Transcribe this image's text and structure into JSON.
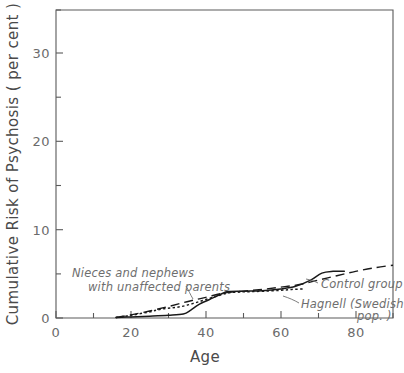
{
  "chart_data": {
    "type": "line",
    "title": "",
    "xlabel": "Age",
    "ylabel": "Cumulative Risk of Psychosis ( per cent )",
    "xlim": [
      0,
      90
    ],
    "ylim": [
      0,
      35
    ],
    "xticks": [
      0,
      20,
      40,
      60,
      80
    ],
    "xtick_labels": [
      "0",
      "20",
      "40",
      "60",
      "80"
    ],
    "xticks_minor": [
      10,
      30,
      50,
      70
    ],
    "yticks": [
      0,
      10,
      20,
      30
    ],
    "ytick_labels": [
      "0",
      "10",
      "20",
      "30"
    ],
    "yticks_minor": [
      5,
      15,
      25,
      35
    ],
    "grid": false,
    "legend_position": "inline-annotations",
    "series": [
      {
        "name": "Nieces and nephews with unaffected parents",
        "style": "solid",
        "x": [
          16,
          20,
          25,
          30,
          34,
          36,
          38,
          41,
          44,
          46,
          50,
          55,
          60,
          64,
          68,
          71,
          74,
          77
        ],
        "y": [
          0.05,
          0.12,
          0.2,
          0.3,
          0.45,
          0.9,
          1.5,
          2.1,
          2.7,
          3.0,
          3.05,
          3.1,
          3.3,
          3.6,
          4.3,
          5.1,
          5.3,
          5.3
        ]
      },
      {
        "name": "Control group",
        "style": "dashed",
        "x": [
          16,
          20,
          25,
          30,
          35,
          40,
          45,
          50,
          55,
          60,
          65,
          70,
          75,
          80,
          85,
          90
        ],
        "y": [
          0.05,
          0.35,
          0.8,
          1.3,
          1.85,
          2.35,
          2.85,
          3.05,
          3.25,
          3.5,
          3.8,
          4.3,
          4.8,
          5.3,
          5.7,
          6.0
        ]
      },
      {
        "name": "Hagnell (Swedish pop.)",
        "style": "dotted",
        "x": [
          16,
          20,
          25,
          28,
          31,
          34,
          37,
          40,
          43,
          46,
          49,
          52,
          56,
          60,
          63,
          66
        ],
        "y": [
          0.05,
          0.3,
          0.7,
          1.0,
          1.15,
          1.35,
          1.7,
          2.1,
          2.5,
          2.85,
          2.95,
          3.0,
          3.05,
          3.15,
          3.25,
          3.3
        ]
      }
    ],
    "annotations": [
      {
        "name": "nieces-nephews-annotation",
        "line1": "Nieces and nephews",
        "line2": "with unaffected parents"
      },
      {
        "name": "control-group-annotation",
        "line1": "Control group"
      },
      {
        "name": "hagnell-annotation",
        "line1": "Hagnell (Swedish",
        "line2": "pop. )"
      }
    ],
    "colors": {
      "line": "#1a1a1a",
      "axis": "#5a5a5a",
      "text": "#6b6b6b",
      "background": "#ffffff"
    }
  }
}
